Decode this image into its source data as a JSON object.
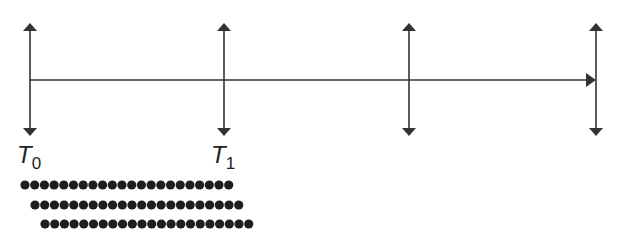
{
  "diagram": {
    "type": "timeline",
    "timeline": {
      "x_start": 30,
      "x_end": 596,
      "y": 80,
      "color": "#333333"
    },
    "markers": [
      {
        "id": "t0",
        "x": 30,
        "label": "T",
        "subscript": "0"
      },
      {
        "id": "t1",
        "x": 224,
        "label": "T",
        "subscript": "1"
      },
      {
        "id": "t2",
        "x": 409,
        "label": "",
        "subscript": ""
      },
      {
        "id": "t3",
        "x": 596,
        "label": "",
        "subscript": ""
      }
    ],
    "marker_top": 23,
    "marker_bottom": 136,
    "dot_rows": [
      {
        "x_start": 25,
        "y": 185,
        "count": 22
      },
      {
        "x_start": 35,
        "y": 205,
        "count": 22
      },
      {
        "x_start": 45,
        "y": 224,
        "count": 22
      }
    ],
    "dot_spacing": 9.7,
    "dot_radius": 4.6,
    "stroke_color": "#333333",
    "dot_color": "#1e1e1e"
  }
}
